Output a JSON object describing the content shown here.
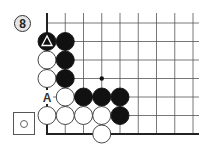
{
  "problem": {
    "number": "8",
    "to_play_icon": "white-stone-in-square"
  },
  "board": {
    "origin_x": 47,
    "origin_y": 23,
    "spacing_x": 18.25,
    "spacing_y": 18.5,
    "cols": 9,
    "rows": 7,
    "edges": [
      "left",
      "bottom"
    ],
    "right_extent_x": 199,
    "top_extent_y": 13,
    "hoshi": [
      {
        "col": 3,
        "row": 3
      }
    ],
    "stones": [
      {
        "col": 0,
        "row": 1,
        "color": "black",
        "mark": "triangle"
      },
      {
        "col": 1,
        "row": 1,
        "color": "black"
      },
      {
        "col": 0,
        "row": 2,
        "color": "white"
      },
      {
        "col": 1,
        "row": 2,
        "color": "black"
      },
      {
        "col": 0,
        "row": 3,
        "color": "white"
      },
      {
        "col": 1,
        "row": 3,
        "color": "black"
      },
      {
        "col": 1,
        "row": 4,
        "color": "white"
      },
      {
        "col": 2,
        "row": 4,
        "color": "black"
      },
      {
        "col": 3,
        "row": 4,
        "color": "black"
      },
      {
        "col": 4,
        "row": 4,
        "color": "black"
      },
      {
        "col": 0,
        "row": 5,
        "color": "white"
      },
      {
        "col": 1,
        "row": 5,
        "color": "white"
      },
      {
        "col": 2,
        "row": 5,
        "color": "white"
      },
      {
        "col": 3,
        "row": 5,
        "color": "white"
      },
      {
        "col": 4,
        "row": 5,
        "color": "black"
      },
      {
        "col": 3,
        "row": 6,
        "color": "white"
      }
    ],
    "labels": [
      {
        "col": 0,
        "row": 4,
        "text": "A"
      }
    ]
  },
  "colors": {
    "black_stone": "#111111",
    "white_stone": "#ffffff",
    "line": "#555555",
    "edge": "#222222"
  }
}
